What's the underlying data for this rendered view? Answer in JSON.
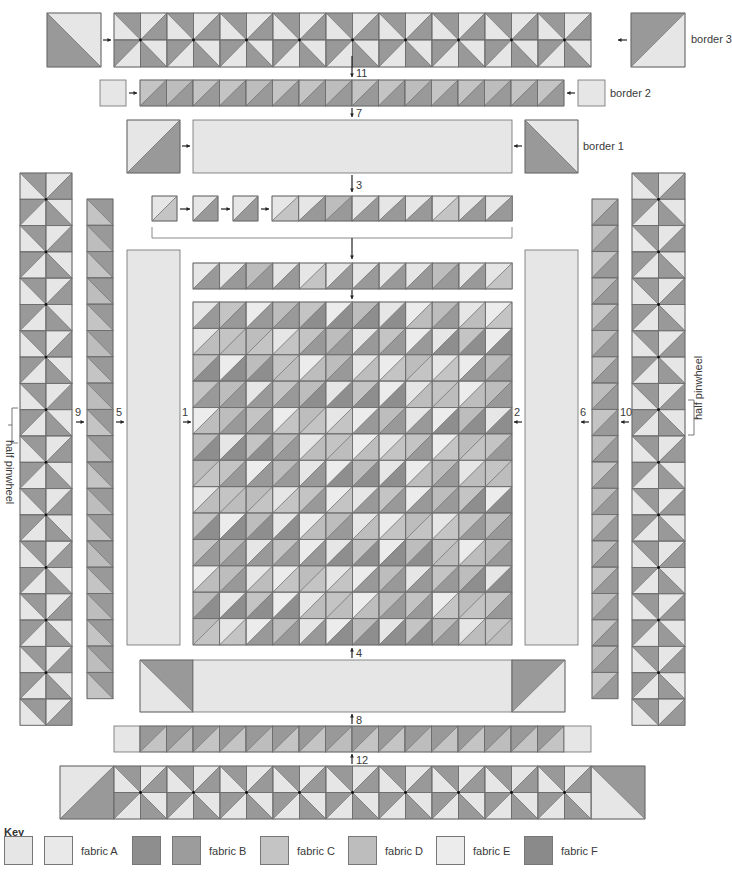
{
  "title_partial": "ASSEMBLY",
  "colors": {
    "fabric_A": "#e6e6e6",
    "fabric_B": "#999999",
    "fabric_B_dark": "#8e8e8e",
    "fabric_C": "#c4c4c4",
    "fabric_D": "#bdbdbd",
    "fabric_E": "#ececec",
    "fabric_F": "#8a8a8a",
    "outline": "#6d6d6d",
    "arrow": "#222222"
  },
  "labels": {
    "border3": "border 3",
    "border2": "border 2",
    "border1": "border 1",
    "half_pinwheel_left": "half pinwheel",
    "half_pinwheel_right": "half pinwheel"
  },
  "steps": [
    {
      "n": "1",
      "x": 182,
      "y": 407
    },
    {
      "n": "2",
      "x": 514,
      "y": 407
    },
    {
      "n": "3",
      "x": 356,
      "y": 180
    },
    {
      "n": "4",
      "x": 356,
      "y": 648
    },
    {
      "n": "5",
      "x": 116,
      "y": 407
    },
    {
      "n": "6",
      "x": 580,
      "y": 407
    },
    {
      "n": "7",
      "x": 356,
      "y": 108
    },
    {
      "n": "8",
      "x": 356,
      "y": 715
    },
    {
      "n": "9",
      "x": 75,
      "y": 407
    },
    {
      "n": "10",
      "x": 620,
      "y": 407
    },
    {
      "n": "11",
      "x": 356,
      "y": 68
    },
    {
      "n": "12",
      "x": 356,
      "y": 755
    }
  ],
  "key": {
    "title": "Key",
    "items": [
      {
        "label": "fabric A",
        "swatches": [
          "#e6e6e6",
          "#e9e9e9"
        ]
      },
      {
        "label": "fabric B",
        "swatches": [
          "#8e8e8e",
          "#9c9c9c"
        ]
      },
      {
        "label": "fabric C",
        "swatches": [
          "#c4c4c4"
        ]
      },
      {
        "label": "fabric D",
        "swatches": [
          "#bdbdbd"
        ]
      },
      {
        "label": "fabric E",
        "swatches": [
          "#ececec"
        ]
      },
      {
        "label": "fabric F",
        "swatches": [
          "#8a8a8a"
        ]
      }
    ]
  },
  "grid": {
    "cols": 12,
    "rows": 13,
    "light": [
      "#e6e6e6",
      "#c4c4c4",
      "#ececec",
      "#bdbdbd"
    ],
    "dark": [
      "#999999",
      "#8e8e8e",
      "#bdbdbd",
      "#c4c4c4"
    ]
  }
}
